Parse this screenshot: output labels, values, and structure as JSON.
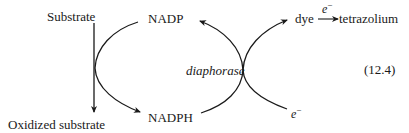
{
  "diagram": {
    "type": "reaction-scheme",
    "equation_number": "(12.4)",
    "labels": {
      "substrate": "Substrate",
      "oxidized_substrate": "Oxidized substrate",
      "nadp": "NADP",
      "nadph": "NADPH",
      "enzyme": "diaphorase",
      "dye": "dye",
      "tetrazolium": "tetrazolium",
      "electron_top": "e",
      "electron_top_charge": "−",
      "electron_bottom": "e",
      "electron_bottom_charge": "−"
    },
    "edges": [
      {
        "from": "Substrate",
        "to": "Oxidized substrate",
        "kind": "straight-arrow"
      },
      {
        "from": "NADP",
        "to": "NADPH",
        "kind": "curved-arrow",
        "coupled_with": "Substrate -> Oxidized substrate"
      },
      {
        "from": "NADPH",
        "to": "NADP",
        "kind": "curved-arrow",
        "via": "diaphorase"
      },
      {
        "from": "e−",
        "to": "dye",
        "kind": "curved-arrow",
        "via": "diaphorase"
      },
      {
        "from": "dye",
        "to": "tetrazolium",
        "kind": "straight-arrow",
        "label": "e−"
      }
    ],
    "colors": {
      "stroke": "#1a1a1a",
      "text": "#1a1a1a",
      "background": "#ffffff"
    }
  }
}
